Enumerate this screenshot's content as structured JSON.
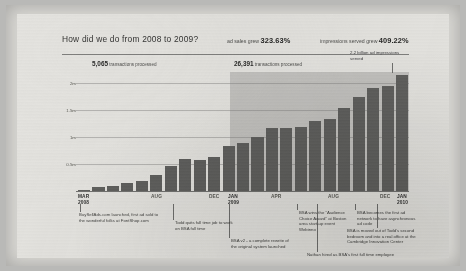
{
  "header": {
    "title": "How did we do from 2008 to 2009?",
    "stat_sales_prefix": "ad sales grew",
    "stat_sales_value": "323.63%",
    "stat_impressions_prefix": "impressions served grew",
    "stat_impressions_value": "409.22%"
  },
  "callouts": {
    "y2008_value": "5,065",
    "y2008_label": "transactions processed",
    "y2009_value": "26,391",
    "y2009_label": "transactions processed",
    "impressions": "2.2 billion ad impressions served"
  },
  "annotations": {
    "launch": "BuySellAds.com launched, first ad sold to the wonderful folks at FontShop.com",
    "todd": "Todd quits full time job to work on BSA full time",
    "bsa2": "BSA v2 - a complete rewrite of the original system launched",
    "webinno": "BSA wins the \"Audience Choice Award\" at Boston area start-up event Webinno",
    "async": "BSA becomes the first ad network to have asynchronous ad code",
    "office": "BSA is moved out of Todd's second bedroom and into a real office at the Cambridge Innovation Center",
    "nathan": "Nathan hired as BSA's first full time employee"
  },
  "chart_data": {
    "type": "bar",
    "title": "How did we do from 2008 to 2009?",
    "xlabel": "",
    "ylabel": "",
    "ylim": [
      0,
      2200000
    ],
    "grid": true,
    "legend": false,
    "ytick_labels": [
      "2m",
      "1.5m",
      "1m",
      "0.5m"
    ],
    "ytick_values": [
      2000000,
      1500000,
      1000000,
      500000
    ],
    "categories": [
      "Mar 2008",
      "Apr 2008",
      "May 2008",
      "Jun 2008",
      "Jul 2008",
      "Aug 2008",
      "Sep 2008",
      "Oct 2008",
      "Nov 2008",
      "Dec 2008",
      "Jan 2009",
      "Feb 2009",
      "Mar 2009",
      "Apr 2009",
      "May 2009",
      "Jun 2009",
      "Jul 2009",
      "Aug 2009",
      "Sep 2009",
      "Oct 2009",
      "Nov 2009",
      "Dec 2009",
      "Jan 2010"
    ],
    "values": [
      20000,
      70000,
      90000,
      150000,
      190000,
      290000,
      460000,
      590000,
      580000,
      620000,
      830000,
      880000,
      990000,
      1170000,
      1170000,
      1190000,
      1290000,
      1340000,
      1530000,
      1740000,
      1900000,
      1950000,
      2150000
    ],
    "xtick_labels": [
      {
        "text": "MAR\n2008",
        "index": 0
      },
      {
        "text": "AUG",
        "index": 5
      },
      {
        "text": "DEC",
        "index": 9
      },
      {
        "text": "JAN\n2009",
        "index": 10
      },
      {
        "text": "APR",
        "index": 13
      },
      {
        "text": "AUG",
        "index": 17
      },
      {
        "text": "DEC",
        "index": 21
      },
      {
        "text": "JAN\n2010",
        "index": 22
      }
    ],
    "shaded_region": {
      "from_index": 10,
      "to_index": 22,
      "note": "2009 onward"
    },
    "bar_color": "#5c5c5a",
    "annotations": [
      {
        "label": "5,065 transactions processed",
        "region": "2008"
      },
      {
        "label": "26,391 transactions processed",
        "region": "2009"
      },
      {
        "label": "2.2 billion ad impressions served",
        "region": "Jan 2010"
      }
    ]
  },
  "xaxis": {
    "mar2008_line1": "MAR",
    "mar2008_line2": "2008",
    "aug2008": "AUG",
    "dec2008": "DEC",
    "jan2009_line1": "JAN",
    "jan2009_line2": "2009",
    "apr2009": "APR",
    "aug2009": "AUG",
    "dec2009": "DEC",
    "jan2010_line1": "JAN",
    "jan2010_line2": "2010"
  }
}
